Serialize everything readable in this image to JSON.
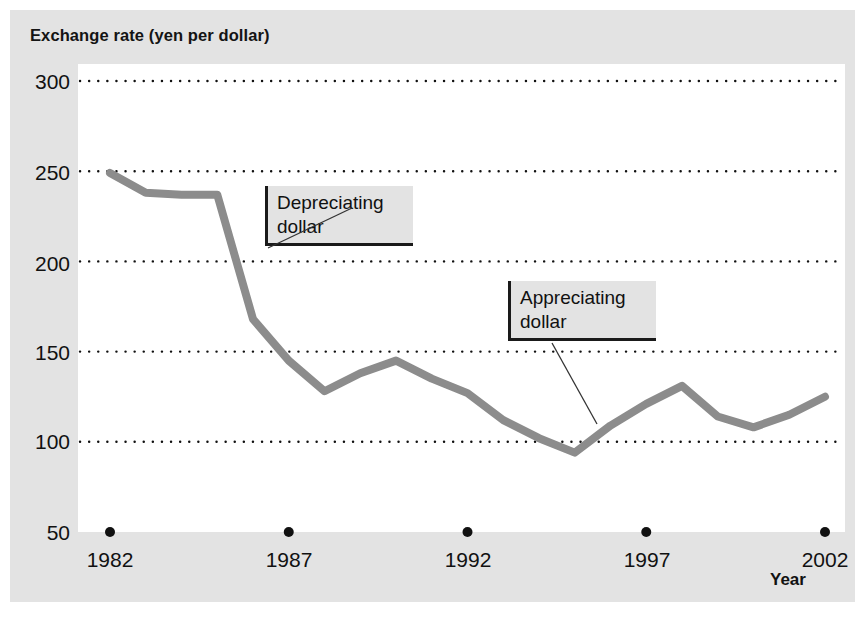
{
  "chart_data": {
    "type": "line",
    "title": "Exchange rate (yen per dollar)",
    "xlabel": "Year",
    "ylabel": "",
    "xlim": [
      1982,
      2002
    ],
    "ylim": [
      50,
      300
    ],
    "yticks": [
      300,
      250,
      200,
      150,
      100,
      50
    ],
    "xticks": [
      1982,
      1987,
      1992,
      1997,
      2002
    ],
    "grid": "horizontal-dotted",
    "legend": "none",
    "line_color": "#8c8c8c",
    "x": [
      1982,
      1983,
      1984,
      1985,
      1986,
      1987,
      1988,
      1989,
      1990,
      1991,
      1992,
      1993,
      1994,
      1995,
      1996,
      1997,
      1998,
      1999,
      2000,
      2001,
      2002
    ],
    "values": [
      249,
      238,
      237,
      237,
      168,
      145,
      128,
      138,
      145,
      135,
      127,
      112,
      102,
      94,
      109,
      121,
      131,
      114,
      108,
      115,
      125
    ],
    "series": [
      {
        "name": "Exchange rate (yen per dollar)",
        "values": [
          249,
          238,
          237,
          237,
          168,
          145,
          128,
          138,
          145,
          135,
          127,
          112,
          102,
          94,
          109,
          121,
          131,
          114,
          108,
          115,
          125
        ]
      }
    ],
    "annotations": [
      {
        "label": "Depreciating dollar",
        "line1": "Depreciating",
        "line2": "dollar",
        "points_to_year": 1985.6,
        "points_to_value": 190
      },
      {
        "label": "Appreciating dollar",
        "line1": "Appreciating",
        "line2": "dollar",
        "points_to_year": 1995.6,
        "points_to_value": 105
      }
    ]
  },
  "ticks": {
    "y": [
      "300",
      "250",
      "200",
      "150",
      "100",
      "50"
    ],
    "x": [
      "1982",
      "1987",
      "1992",
      "1997",
      "2002"
    ]
  },
  "labels": {
    "title": "Exchange rate (yen per dollar)",
    "xaxis": "Year",
    "annot1_line1": "Depreciating",
    "annot1_line2": "dollar",
    "annot2_line1": "Appreciating",
    "annot2_line2": "dollar"
  }
}
